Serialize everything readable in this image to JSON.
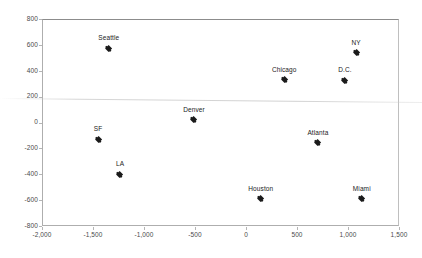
{
  "chart_data": {
    "type": "scatter",
    "title": "",
    "xlabel": "",
    "ylabel": "",
    "xlim": [
      -2000,
      1500
    ],
    "ylim": [
      -800,
      800
    ],
    "xticks": [
      "-2,000",
      "-1,500",
      "-1,000",
      "-500",
      "0",
      "500",
      "1,000",
      "1,500"
    ],
    "xtick_values": [
      -2000,
      -1500,
      -1000,
      -500,
      0,
      500,
      1000,
      1500
    ],
    "yticks": [
      "800",
      "600",
      "400",
      "200",
      "0",
      "-200",
      "-400",
      "-600",
      "-800"
    ],
    "ytick_values": [
      800,
      600,
      400,
      200,
      0,
      -200,
      -400,
      -600,
      -800
    ],
    "grid": false,
    "legend": false,
    "marker_color": "#1b1b1b",
    "points": [
      {
        "label": "Seattle",
        "x": -1345,
        "y": 575
      },
      {
        "label": "SF",
        "x": -1450,
        "y": -130
      },
      {
        "label": "LA",
        "x": -1235,
        "y": -400
      },
      {
        "label": "Denver",
        "x": -510,
        "y": 20
      },
      {
        "label": "Chicago",
        "x": 375,
        "y": 330
      },
      {
        "label": "NY",
        "x": 1080,
        "y": 540
      },
      {
        "label": "D.C.",
        "x": 970,
        "y": 325
      },
      {
        "label": "Atlanta",
        "x": 705,
        "y": -155
      },
      {
        "label": "Houston",
        "x": 145,
        "y": -590
      },
      {
        "label": "Miami",
        "x": 1135,
        "y": -590
      }
    ]
  }
}
